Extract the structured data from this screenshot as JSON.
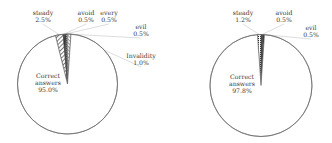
{
  "chart_data": [
    {
      "type": "pie",
      "title": "",
      "start_angle_deg": -14,
      "direction": "clockwise",
      "geometry": {
        "cx": 67.5,
        "cy": 84,
        "r": 50
      },
      "slices": [
        {
          "label": "steady",
          "value": 2.5,
          "display": "2.5%",
          "fill": "hatch",
          "label_pos": [
            43,
            15
          ],
          "anchor": "middle",
          "leader": true
        },
        {
          "label": "avoid",
          "value": 0.5,
          "display": "0.5%",
          "fill": "#1a1a1a",
          "label_pos": [
            86,
            15
          ],
          "anchor": "middle",
          "leader": true
        },
        {
          "label": "every",
          "value": 0.5,
          "display": "0.5%",
          "fill": "#333333",
          "label_pos": [
            109,
            15
          ],
          "anchor": "middle",
          "leader": true
        },
        {
          "label": "evil",
          "value": 0.5,
          "display": "0.5%",
          "fill": "dots",
          "label_pos": [
            141,
            29
          ],
          "anchor": "middle",
          "leader": true
        },
        {
          "label": "Invalidity",
          "value": 1.0,
          "display": "1.0%",
          "fill": "hatch2",
          "label_pos": [
            141,
            58
          ],
          "anchor": "middle",
          "leader": true
        },
        {
          "label": "Correct answers",
          "value": 95.0,
          "display": "95.0%",
          "fill": "#ffffff",
          "label_pos": [
            48,
            78
          ],
          "anchor": "middle",
          "leader": false,
          "lines": [
            "Correct",
            "answers"
          ]
        }
      ]
    },
    {
      "type": "pie",
      "title": "",
      "start_angle_deg": -4,
      "direction": "clockwise",
      "geometry": {
        "cx": 261,
        "cy": 85.5,
        "r": 51
      },
      "slices": [
        {
          "label": "steady",
          "value": 1.2,
          "display": "1.2%",
          "fill": "dots",
          "label_pos": [
            243,
            15
          ],
          "anchor": "middle",
          "leader": true
        },
        {
          "label": "avoid",
          "value": 0.5,
          "display": "0.5%",
          "fill": "#1a1a1a",
          "label_pos": [
            284,
            15
          ],
          "anchor": "middle",
          "leader": true
        },
        {
          "label": "evil",
          "value": 0.5,
          "display": "0.5%",
          "fill": "#333333",
          "label_pos": [
            311,
            30
          ],
          "anchor": "middle",
          "leader": true
        },
        {
          "label": "Correct answers",
          "value": 97.8,
          "display": "97.8%",
          "fill": "#ffffff",
          "label_pos": [
            242,
            79
          ],
          "anchor": "middle",
          "leader": false,
          "lines": [
            "Correct",
            "answers"
          ]
        }
      ]
    }
  ]
}
